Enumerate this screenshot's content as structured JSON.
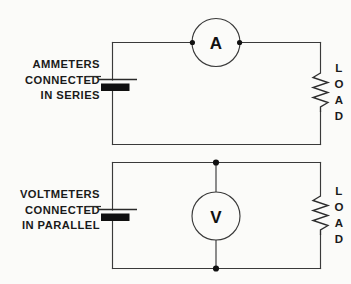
{
  "figure": {
    "background_color": "#fbfbf9",
    "ink_color": "#1a1a1a"
  },
  "circuits": [
    {
      "id": "ammeter-circuit",
      "caption": {
        "line1": "AMMETERS",
        "line2": "CONNECTED",
        "line3": "IN SERIES"
      },
      "meter": {
        "symbol": "A",
        "name": "ammeter",
        "connection": "series",
        "lead_orientation": "horizontal"
      },
      "source": {
        "name": "battery",
        "positive_plate": "long-thin-line",
        "negative_plate": "short-thick-bar"
      },
      "load": {
        "letters": [
          "L",
          "O",
          "A",
          "D"
        ],
        "symbol": "resistor-zigzag"
      },
      "junction_dots": 2
    },
    {
      "id": "voltmeter-circuit",
      "caption": {
        "line1": "VOLTMETERS",
        "line2": "CONNECTED",
        "line3": "IN PARALLEL"
      },
      "meter": {
        "symbol": "V",
        "name": "voltmeter",
        "connection": "parallel",
        "lead_orientation": "vertical"
      },
      "source": {
        "name": "battery",
        "positive_plate": "long-thin-line",
        "negative_plate": "short-thick-bar"
      },
      "load": {
        "letters": [
          "L",
          "O",
          "A",
          "D"
        ],
        "symbol": "resistor-zigzag"
      },
      "junction_dots": 2
    }
  ]
}
